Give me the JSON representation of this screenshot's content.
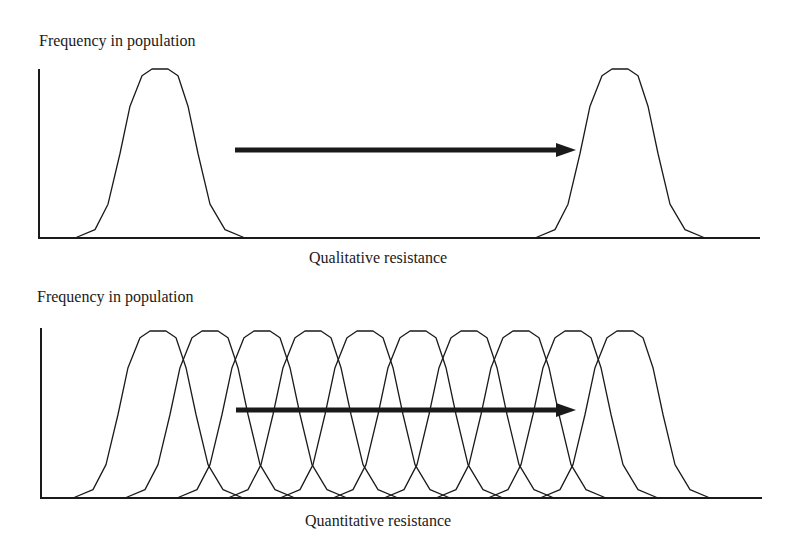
{
  "panels": [
    {
      "id": "qualitative",
      "y_label": "Frequency in population",
      "x_label": "Qualitative resistance",
      "curve_peaks_x": [
        160,
        620
      ],
      "arrow": {
        "from_x": 235,
        "to_x": 576,
        "y": 150
      }
    },
    {
      "id": "quantitative",
      "y_label": "Frequency in population",
      "x_label": "Quantitative resistance",
      "curve_peaks_x": [
        158,
        210,
        262,
        313,
        365,
        418,
        469,
        521,
        573,
        625
      ],
      "arrow": {
        "from_x": 236,
        "to_x": 576,
        "y": 410
      }
    }
  ],
  "colors": {
    "line": "#1a1a1a",
    "background": "#ffffff"
  }
}
